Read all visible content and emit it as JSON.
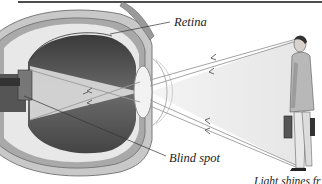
{
  "diagram": {
    "labels": {
      "retina": "Retina",
      "blind_spot": "Blind spot",
      "caption_partial": "Light shines fr"
    },
    "elements": {
      "eye": "cross-section of eyeball",
      "lens": "lens",
      "optic_nerve": "optic nerve",
      "person": "man standing holding briefcase",
      "light_rays": "light cone from person to eye",
      "arrows": "arrowheads pointing toward eye"
    },
    "colors": {
      "background": "#ffffff",
      "ink": "#222222",
      "eye_interior": "#5a5a5a",
      "sclera": "#b8b8b8",
      "light_cone": "#ececec",
      "top_rule": "#111111"
    }
  }
}
